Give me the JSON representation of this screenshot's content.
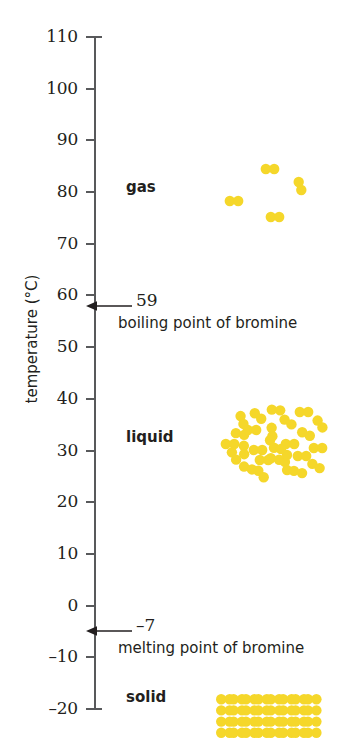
{
  "figure": {
    "axis_title": "temperature (°C)",
    "particle_color": "#f5d72a",
    "axis_color": "#58595b",
    "text_color": "#231f20"
  },
  "chart_data": {
    "type": "scatter",
    "title": "",
    "xlabel": "",
    "ylabel": "temperature (°C)",
    "ylim": [
      -20,
      110
    ],
    "ytick_step": 10,
    "tick_labels": [
      "110",
      "100",
      "90",
      "80",
      "70",
      "60",
      "50",
      "40",
      "30",
      "20",
      "10",
      "0",
      "–10",
      "–20"
    ],
    "tick_values": [
      110,
      100,
      90,
      80,
      70,
      60,
      50,
      40,
      30,
      20,
      10,
      0,
      -10,
      -20
    ],
    "grid": false,
    "legend": "none",
    "annotations": [
      {
        "name": "boiling-point",
        "value": "59",
        "numeric_value": 59,
        "caption": "boiling point of bromine"
      },
      {
        "name": "melting-point",
        "value": "–7",
        "numeric_value": -7,
        "caption": "melting point of bromine"
      }
    ],
    "series": [
      {
        "name": "gas",
        "label": "gas",
        "label_temperature": 80,
        "arrangement": "sparse-diatomic-molecules",
        "molecule_count": 4,
        "temperature_range": [
          75,
          86
        ],
        "molecules": [
          {
            "x": 22,
            "y": 37,
            "angle": 0
          },
          {
            "x": 58,
            "y": 5,
            "angle": 0
          },
          {
            "x": 63,
            "y": 53,
            "angle": 0
          },
          {
            "x": 88,
            "y": 22,
            "angle": 72
          }
        ]
      },
      {
        "name": "liquid",
        "label": "liquid",
        "label_temperature": 30,
        "arrangement": "dense-random-molecules",
        "molecule_count": 26,
        "temperature_range": [
          24,
          36
        ],
        "molecules": [
          {
            "x": 12,
            "y": 30,
            "angle": 12
          },
          {
            "x": 30,
            "y": 12,
            "angle": 40
          },
          {
            "x": 30,
            "y": 46,
            "angle": 0
          },
          {
            "x": 6,
            "y": 52,
            "angle": 60
          },
          {
            "x": 20,
            "y": 64,
            "angle": 20
          },
          {
            "x": 44,
            "y": 28,
            "angle": 85
          },
          {
            "x": 48,
            "y": 6,
            "angle": 5
          },
          {
            "x": 47,
            "y": 55,
            "angle": 10
          },
          {
            "x": 33,
            "y": 70,
            "angle": 50
          },
          {
            "x": 60,
            "y": 18,
            "angle": 35
          },
          {
            "x": 62,
            "y": 40,
            "angle": 0
          },
          {
            "x": 58,
            "y": 62,
            "angle": 75
          },
          {
            "x": 76,
            "y": 8,
            "angle": 0
          },
          {
            "x": 78,
            "y": 30,
            "angle": 25
          },
          {
            "x": 74,
            "y": 52,
            "angle": 0
          },
          {
            "x": 70,
            "y": 68,
            "angle": 15
          },
          {
            "x": 92,
            "y": 20,
            "angle": 55
          },
          {
            "x": 90,
            "y": 44,
            "angle": 0
          },
          {
            "x": 88,
            "y": 62,
            "angle": 30
          },
          {
            "x": 14,
            "y": 16,
            "angle": 70
          },
          {
            "x": 2,
            "y": 40,
            "angle": 0
          },
          {
            "x": 44,
            "y": 40,
            "angle": 62
          },
          {
            "x": 24,
            "y": 26,
            "angle": 0
          },
          {
            "x": 56,
            "y": 48,
            "angle": 45
          },
          {
            "x": 36,
            "y": 56,
            "angle": 0
          },
          {
            "x": 16,
            "y": 46,
            "angle": 88
          }
        ]
      },
      {
        "name": "solid",
        "label": "solid",
        "label_temperature": -20,
        "arrangement": "regular-lattice",
        "lattice_columns": 8,
        "lattice_rows": 4,
        "temperature_range": [
          -20,
          -20
        ]
      }
    ]
  }
}
